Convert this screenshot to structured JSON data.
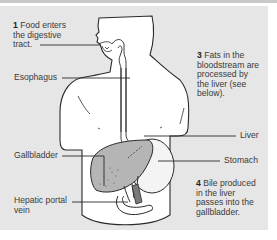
{
  "diagram": {
    "type": "anatomical-illustration",
    "colors": {
      "background": "#e6e6e6",
      "body_fill": "#ffffff",
      "outline": "#2a2a2a",
      "liver_fill": "#b9b9b9",
      "label_text": "#3a3a3a"
    }
  },
  "steps": [
    {
      "number": "1",
      "text": "Food enters the digestive tract."
    },
    {
      "number": "3",
      "text": "Fats in the bloodstream are processed by the liver (see below)."
    },
    {
      "number": "4",
      "text": "Bile produced in the liver passes into the gallbladder."
    }
  ],
  "labels": {
    "esophagus": "Esophagus",
    "liver": "Liver",
    "gallbladder": "Gallbladder",
    "stomach": "Stomach",
    "hepatic_portal_vein": "Hepatic portal vein"
  }
}
